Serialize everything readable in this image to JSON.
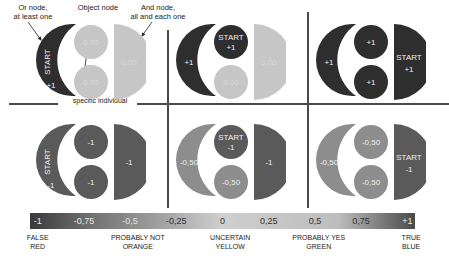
{
  "annotations": {
    "or_node": "Or node,\nat least one",
    "object_node": "Object node",
    "and_node": "And node,\nall and each one",
    "specific_individual": "specific individual"
  },
  "panels": [
    {
      "id": "top-left",
      "crescent": {
        "label": "START",
        "value": "+1",
        "color": "#2e2e2e"
      },
      "circle_top": {
        "label": "",
        "value": "0,00",
        "color": "#c6c6c6"
      },
      "circle_bottom": {
        "label": "",
        "value": "0,00",
        "color": "#c6c6c6"
      },
      "half": {
        "label": "",
        "value": "0,00",
        "color": "#c6c6c6"
      }
    },
    {
      "id": "top-middle",
      "crescent": {
        "label": "",
        "value": "+1",
        "color": "#2e2e2e"
      },
      "circle_top": {
        "label": "START",
        "value": "+1",
        "color": "#2e2e2e"
      },
      "circle_bottom": {
        "label": "",
        "value": "0,00",
        "color": "#c6c6c6"
      },
      "half": {
        "label": "",
        "value": "0,00",
        "color": "#c6c6c6"
      }
    },
    {
      "id": "top-right",
      "crescent": {
        "label": "",
        "value": "+1",
        "color": "#2e2e2e"
      },
      "circle_top": {
        "label": "",
        "value": "+1",
        "color": "#2e2e2e"
      },
      "circle_bottom": {
        "label": "",
        "value": "+1",
        "color": "#2e2e2e"
      },
      "half": {
        "label": "START",
        "value": "+1",
        "color": "#2e2e2e"
      }
    },
    {
      "id": "bottom-left",
      "crescent": {
        "label": "START",
        "value": "-1",
        "color": "#5a5a5a"
      },
      "circle_top": {
        "label": "",
        "value": "-1",
        "color": "#5a5a5a"
      },
      "circle_bottom": {
        "label": "",
        "value": "-1",
        "color": "#5a5a5a"
      },
      "half": {
        "label": "",
        "value": "-1",
        "color": "#5a5a5a"
      }
    },
    {
      "id": "bottom-middle",
      "crescent": {
        "label": "",
        "value": "-0,50",
        "color": "#8d8d8d"
      },
      "circle_top": {
        "label": "START",
        "value": "-1",
        "color": "#5a5a5a"
      },
      "circle_bottom": {
        "label": "",
        "value": "-0,50",
        "color": "#8d8d8d"
      },
      "half": {
        "label": "",
        "value": "-1",
        "color": "#5a5a5a"
      }
    },
    {
      "id": "bottom-right",
      "crescent": {
        "label": "",
        "value": "-0,50",
        "color": "#8d8d8d"
      },
      "circle_top": {
        "label": "",
        "value": "-0,50",
        "color": "#8d8d8d"
      },
      "circle_bottom": {
        "label": "",
        "value": "-0,50",
        "color": "#8d8d8d"
      },
      "half": {
        "label": "START",
        "value": "-1",
        "color": "#5a5a5a"
      }
    }
  ],
  "scale": {
    "ticks": [
      {
        "value": "-1",
        "pos": 2
      },
      {
        "value": "-0,75",
        "pos": 14
      },
      {
        "value": "-0,5",
        "pos": 26
      },
      {
        "value": "-0,25",
        "pos": 38
      },
      {
        "value": "0",
        "pos": 50
      },
      {
        "value": "0,25",
        "pos": 62
      },
      {
        "value": "0,5",
        "pos": 74
      },
      {
        "value": "0,75",
        "pos": 86
      },
      {
        "value": "+1",
        "pos": 98
      }
    ],
    "legend": [
      {
        "line1": "FALSE",
        "line2": "RED",
        "pos": 2
      },
      {
        "line1": "PROBABLY NOT",
        "line2": "ORANGE",
        "pos": 28
      },
      {
        "line1": "UNCERTAIN",
        "line2": "YELLOW",
        "pos": 52
      },
      {
        "line1": "PROBABLY YES",
        "line2": "GREEN",
        "pos": 75
      },
      {
        "line1": "TRUE",
        "line2": "BLUE",
        "pos": 99
      }
    ]
  }
}
